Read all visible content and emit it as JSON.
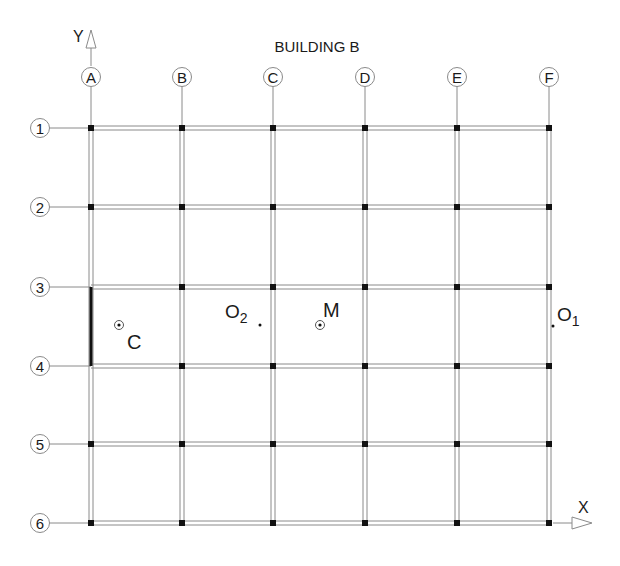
{
  "title": "BUILDING B",
  "axes": {
    "x_label": "X",
    "y_label": "Y"
  },
  "columns": [
    {
      "label": "A",
      "x": 91
    },
    {
      "label": "B",
      "x": 182
    },
    {
      "label": "C",
      "x": 273
    },
    {
      "label": "D",
      "x": 365
    },
    {
      "label": "E",
      "x": 457
    },
    {
      "label": "F",
      "x": 549
    }
  ],
  "rows": [
    {
      "label": "1",
      "y": 128
    },
    {
      "label": "2",
      "y": 207
    },
    {
      "label": "3",
      "y": 287
    },
    {
      "label": "4",
      "y": 366
    },
    {
      "label": "5",
      "y": 444
    },
    {
      "label": "6",
      "y": 523
    }
  ],
  "points": {
    "C": {
      "label": "C",
      "marker": "circled-dot"
    },
    "M": {
      "label": "M",
      "marker": "circled-dot"
    },
    "O1": {
      "label": "O",
      "subscript": "1",
      "marker": "dot"
    },
    "O2": {
      "label": "O",
      "subscript": "2",
      "marker": "dot"
    }
  },
  "highlighted_wall": {
    "column": "A",
    "from_row": "3",
    "to_row": "4"
  },
  "colors": {
    "line": "#8a8a8a",
    "column_node": "#111111",
    "text": "#1a1a1a",
    "wall": "#111111"
  }
}
